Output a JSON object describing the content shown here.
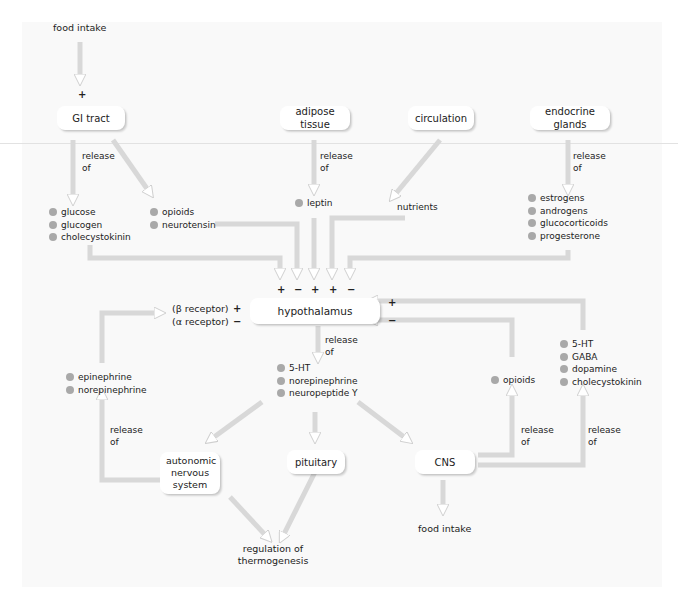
{
  "diagram": {
    "top_input": "food intake",
    "sources": [
      {
        "id": "gi",
        "label": "GI tract"
      },
      {
        "id": "adipose",
        "label": "adipose tissue"
      },
      {
        "id": "circulation",
        "label": "circulation"
      },
      {
        "id": "endocrine",
        "label": "endocrine glands"
      }
    ],
    "release_label": [
      "release",
      "of"
    ],
    "gi_signals_a": [
      "glucose",
      "glucogen",
      "cholecystokinin"
    ],
    "gi_signals_b": [
      "opioids",
      "neurotensin"
    ],
    "adipose_signals": [
      "leptin"
    ],
    "circulation_signals": "nutrients",
    "endocrine_signals": [
      "estrogens",
      "androgens",
      "glucocorticoids",
      "progesterone"
    ],
    "input_signs": [
      "+",
      "−",
      "+",
      "+",
      "−"
    ],
    "hub": "hypothalamus",
    "receptors": [
      "(β receptor)",
      "(α receptor)"
    ],
    "receptor_signs": [
      "+",
      "−"
    ],
    "right_signs": [
      "+",
      "−"
    ],
    "hypothalamus_outputs": [
      "5-HT",
      "norepinephrine",
      "neuropeptide Y"
    ],
    "ans_outputs": [
      "epinephrine",
      "norepinephrine"
    ],
    "cns_outputs_a": [
      "opioids"
    ],
    "cns_outputs_b": [
      "5-HT",
      "GABA",
      "dopamine",
      "cholecystokinin"
    ],
    "targets": [
      {
        "id": "ans",
        "label": "autonomic nervous system"
      },
      {
        "id": "pituitary",
        "label": "pituitary"
      },
      {
        "id": "cns",
        "label": "CNS"
      }
    ],
    "thermo": "regulation of thermogenesis",
    "bottom_output": "food intake"
  },
  "colors": {
    "arrow_stroke": "#d6d6d6",
    "bullet": "#a9a9a9",
    "panel_bg": "#f9f9f9"
  }
}
